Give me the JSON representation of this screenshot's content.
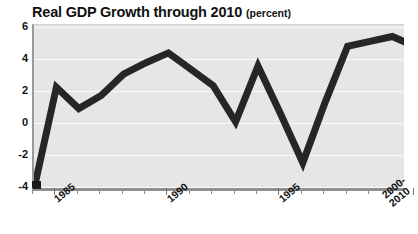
{
  "chart_data": {
    "type": "line",
    "title": "Real GDP Growth through 2010",
    "subtitle": "(percent)",
    "xlabel": "",
    "ylabel": "",
    "ylim": [
      -4,
      6
    ],
    "yticks": [
      6,
      4,
      2,
      0,
      -2,
      -4
    ],
    "ytick_labels": [
      "6",
      "4",
      "2",
      "0",
      "-2",
      "-4"
    ],
    "grid": true,
    "legend": "none",
    "xtick_labels": [
      "1985",
      "1990",
      "1995",
      "2000-\n2010"
    ],
    "xtick_label_years": [
      1985,
      1990,
      1995,
      2000
    ],
    "x": [
      1984,
      1985,
      1986,
      1987,
      1988,
      1989,
      1990,
      1991,
      1992,
      1993,
      1994,
      1995,
      1996,
      1997,
      1998,
      1999,
      2000,
      2010
    ],
    "values": [
      -4.0,
      2.2,
      0.9,
      1.7,
      3.0,
      3.7,
      4.3,
      3.3,
      2.3,
      0.1,
      3.5,
      0.6,
      -2.4,
      1.3,
      4.7,
      5.0,
      5.3,
      4.7
    ],
    "line_color": "#262626",
    "plot_background": "#e6e6e6",
    "gridline_color": "#fafafa",
    "axis_color": "#8f8f8f",
    "text_color": "#111111"
  }
}
